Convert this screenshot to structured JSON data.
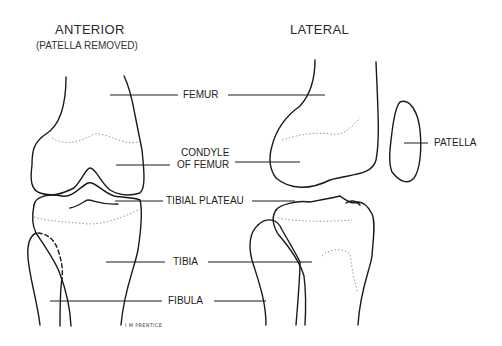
{
  "diagram": {
    "views": [
      {
        "id": "anterior",
        "title": "ANTERIOR",
        "subtitle": "(PATELLA REMOVED)"
      },
      {
        "id": "lateral",
        "title": "LATERAL",
        "subtitle": ""
      }
    ],
    "labels": {
      "femur": "FEMUR",
      "condyle_line1": "CONDYLE",
      "condyle_line2": "OF FEMUR",
      "tibial_plateau": "TIBIAL PLATEAU",
      "tibia": "TIBIA",
      "fibula": "FIBULA",
      "patella": "PATELLA"
    },
    "signature": "I M PRENTICE",
    "colors": {
      "line": "#1a1a1a",
      "dotted": "#9a9a9a",
      "background": "#ffffff"
    }
  }
}
